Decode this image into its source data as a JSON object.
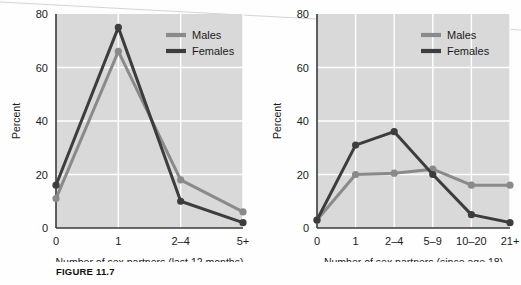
{
  "figure": {
    "caption": "FIGURE 11.7"
  },
  "colors": {
    "plot_background": "#d9d9d9",
    "gridline": "#ffffff",
    "axis": "#3a3a3a",
    "males": "#8a8a8a",
    "females": "#3d3d3d",
    "page_background": "#fefefe",
    "text": "#1b1b1b"
  },
  "legend": {
    "position": "top-right-inside",
    "entries": [
      {
        "label": "Males",
        "color": "#8a8a8a"
      },
      {
        "label": "Females",
        "color": "#3d3d3d"
      }
    ]
  },
  "chart_data": [
    {
      "id": "left",
      "type": "line",
      "title": "",
      "xlabel": "Number of sex partners (last 12 months)",
      "ylabel": "Percent",
      "categories": [
        "0",
        "1",
        "2–4",
        "5+"
      ],
      "ytick_labels": [
        "0",
        "20",
        "40",
        "60",
        "80"
      ],
      "yticks": [
        0,
        20,
        40,
        60,
        80
      ],
      "ylim": [
        0,
        80
      ],
      "grid": true,
      "legend": [
        "Males",
        "Females"
      ],
      "series": [
        {
          "name": "Males",
          "color": "#8a8a8a",
          "values": [
            11,
            66,
            18,
            6
          ]
        },
        {
          "name": "Females",
          "color": "#3d3d3d",
          "values": [
            16,
            75,
            10,
            2
          ]
        }
      ]
    },
    {
      "id": "right",
      "type": "line",
      "title": "",
      "xlabel": "Number of sex partners (since age 18)",
      "ylabel": "Percent",
      "categories": [
        "0",
        "1",
        "2–4",
        "5–9",
        "10–20",
        "21+"
      ],
      "ytick_labels": [
        "0",
        "20",
        "40",
        "60",
        "80"
      ],
      "yticks": [
        0,
        20,
        40,
        60,
        80
      ],
      "ylim": [
        0,
        80
      ],
      "grid": true,
      "legend": [
        "Males",
        "Females"
      ],
      "series": [
        {
          "name": "Males",
          "color": "#8a8a8a",
          "values": [
            3,
            20,
            20.5,
            22,
            16,
            16
          ]
        },
        {
          "name": "Females",
          "color": "#3d3d3d",
          "values": [
            3,
            31,
            36,
            20,
            5,
            2
          ]
        }
      ]
    }
  ]
}
